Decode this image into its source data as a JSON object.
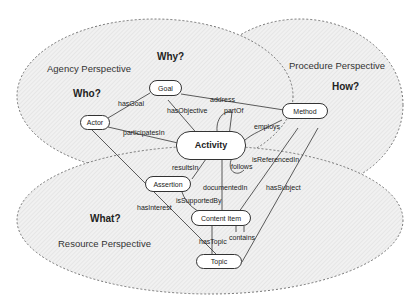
{
  "perspectives": {
    "agency": {
      "label": "Agency Perspective",
      "question_who": "Who?",
      "question_why": "Why?"
    },
    "procedure": {
      "label": "Procedure Perspective",
      "question": "How?"
    },
    "resource": {
      "label": "Resource Perspective",
      "question": "What?"
    }
  },
  "nodes": {
    "goal": "Goal",
    "actor": "Actor",
    "activity": "Activity",
    "method": "Method",
    "assertion": "Assertion",
    "content_item": "Content Item",
    "topic": "Topic"
  },
  "edges": {
    "has_goal": "hasGoal",
    "address": "address",
    "has_objective": "hasObjective",
    "part_of": "partOf",
    "participates_in": "participatesIn",
    "employs": "employs",
    "results_in": "resultsIn",
    "follows": "follows",
    "is_referenced_in": "isReferencedIn",
    "documented_in": "documentedIn",
    "has_subject": "hasSubject",
    "is_supported_by": "isSupportedBy",
    "has_interest": "hasInterest",
    "has_topic": "hasTopic",
    "contains": "contains"
  },
  "colors": {
    "ellipse_fill": "#ececec",
    "ellipse_stroke": "#555555",
    "line": "#333333"
  }
}
